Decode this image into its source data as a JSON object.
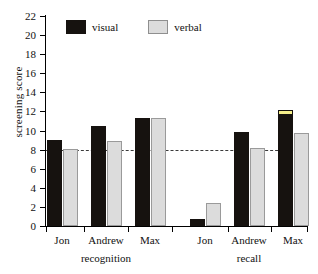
{
  "chart_data": {
    "type": "bar",
    "title": "",
    "xlabel": "",
    "ylabel": "screening score",
    "ylim": [
      0,
      22
    ],
    "ytick_step": 2,
    "yticks": [
      0,
      2,
      4,
      6,
      8,
      10,
      12,
      14,
      16,
      18,
      20,
      22
    ],
    "grid": false,
    "legend_position": "top-left",
    "categories": [
      "Jon",
      "Andrew",
      "Max",
      "Jon",
      "Andrew",
      "Max"
    ],
    "groups": [
      {
        "label": "recognition",
        "categories": [
          "Jon",
          "Andrew",
          "Max"
        ]
      },
      {
        "label": "recall",
        "categories": [
          "Jon",
          "Andrew",
          "Max"
        ]
      }
    ],
    "series": [
      {
        "name": "visual",
        "color": "#16120f",
        "values": [
          9.0,
          10.5,
          11.35,
          0.7,
          9.8,
          12.2
        ]
      },
      {
        "name": "verbal",
        "color": "#dcdcdc",
        "values": [
          8.1,
          8.9,
          11.35,
          2.4,
          8.15,
          9.7
        ]
      }
    ],
    "annotations": [
      {
        "type": "reference-line",
        "axis": "y",
        "value": 8,
        "style": "dashed",
        "color": "#3a3a3a"
      },
      {
        "type": "bar-highlight",
        "series": "visual",
        "category_index": 5,
        "color": "#f5ef8a"
      }
    ]
  },
  "axis": {
    "y_label": "screening score",
    "y_tick_labels": [
      "0",
      "2",
      "4",
      "6",
      "8",
      "10",
      "12",
      "14",
      "16",
      "18",
      "20",
      "22"
    ]
  },
  "legend": {
    "items": [
      {
        "label": "visual",
        "color": "#16120f"
      },
      {
        "label": "verbal",
        "color": "#dcdcdc"
      }
    ]
  },
  "x_axis": {
    "tick_labels": [
      "Jon",
      "Andrew",
      "Max",
      "Jon",
      "Andrew",
      "Max"
    ],
    "group_labels": [
      "recognition",
      "recall"
    ]
  }
}
